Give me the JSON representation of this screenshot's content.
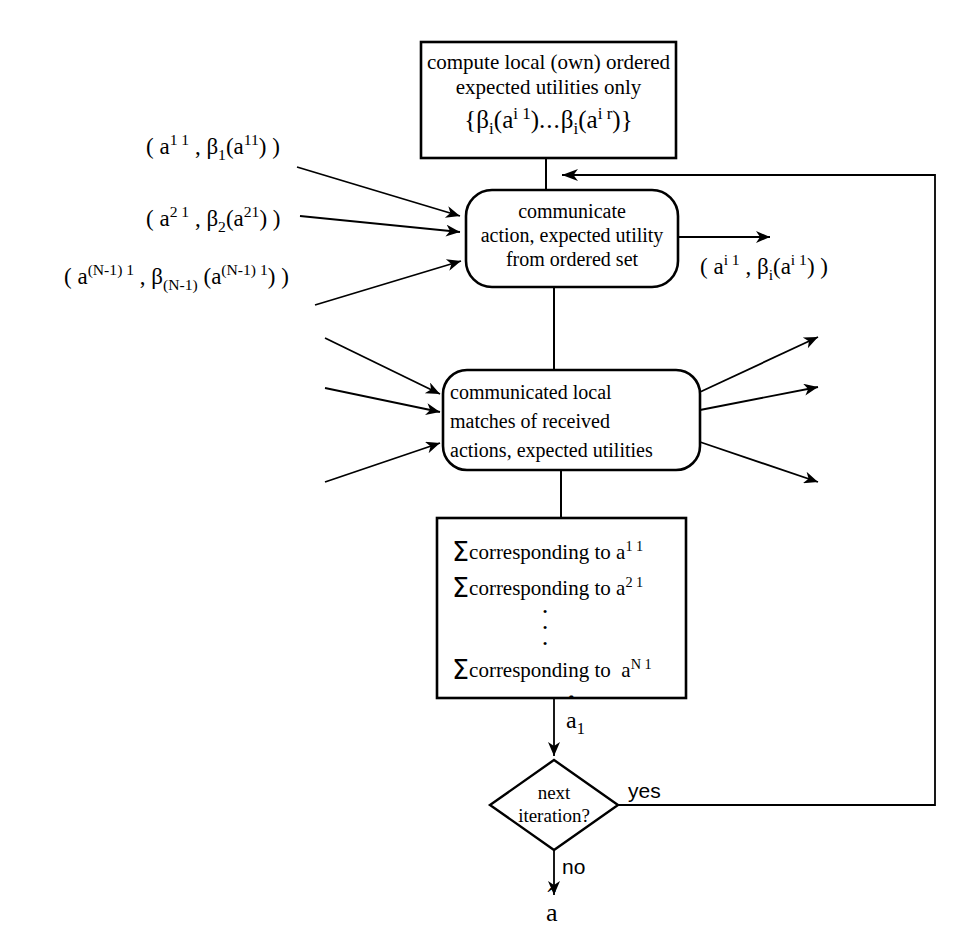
{
  "diagram": {
    "line_color": "#000000",
    "background": "#ffffff",
    "nodes": {
      "compute_box": {
        "name": "compute-local-box",
        "shape": "rectangle",
        "line1": "compute local (own)  ordered",
        "line2": "expected utilities only",
        "formula": {
          "open_brace": "{",
          "beta1": "β",
          "beta1_sub": "i",
          "arg1_open": "(a",
          "arg1_sup": "i 1",
          "arg1_close": ")",
          "ellipsis": "...",
          "beta2": "β",
          "beta2_sub": "i",
          "arg2_open": "(a",
          "arg2_sup": "i r",
          "arg2_close": ")",
          "close_brace": "}"
        }
      },
      "communicate_box": {
        "name": "communicate-action-box",
        "shape": "rounded-rectangle",
        "line1": "communicate",
        "line2": "action, expected utility",
        "line3": "from ordered set"
      },
      "match_box": {
        "name": "communicated-matches-box",
        "shape": "rounded-rectangle",
        "line1": "communicated local",
        "line2": "matches of received",
        "line3": "actions, expected utilities"
      },
      "sum_box": {
        "name": "summation-box",
        "shape": "rectangle",
        "rows": [
          {
            "sigma": "Σ",
            "text": "corresponding to",
            "base": "a",
            "sup": "1 1"
          },
          {
            "sigma": "Σ",
            "text": "corresponding to",
            "base": "a",
            "sup": "2 1"
          },
          {
            "sigma": "Σ",
            "text": "corresponding to",
            "base": "a",
            "sup": "N 1"
          }
        ],
        "vertical_dots": "·"
      },
      "decision": {
        "name": "next-iteration-decision",
        "shape": "diamond",
        "line1": "next",
        "line2": "iteration?"
      }
    },
    "edge_labels": {
      "input1": {
        "open": "( a",
        "sup": "1 1",
        "comma": " , ",
        "beta": "β",
        "beta_sub": "1",
        "arg_open": "(a",
        "arg_sup": "11",
        "arg_close": ")",
        "close": " )"
      },
      "input2": {
        "open": "( a",
        "sup": "2 1",
        "comma": " , ",
        "beta": "β",
        "beta_sub": "2",
        "arg_open": "(a",
        "arg_sup": "21",
        "arg_close": ")",
        "close": " )"
      },
      "input3": {
        "open": "( a",
        "sup": "(N-1) 1",
        "comma": " , ",
        "beta": "β",
        "beta_sub": "(N-1)",
        "arg_open": " (a",
        "arg_sup": "(N-1) 1",
        "arg_close": ")",
        "close": " )"
      },
      "output": {
        "open": "( a",
        "sup": "i 1",
        "comma": " , ",
        "beta": "β",
        "beta_sub": "i",
        "arg_open": "(a",
        "arg_sup": "i 1",
        "arg_close": ")",
        "close": " )"
      },
      "a_hat_1": {
        "hat": "ˆ",
        "base": "a",
        "sub": "1"
      },
      "a_hat_final": {
        "hat": "ˆ",
        "base": "a"
      },
      "yes": "yes",
      "no": "no"
    }
  }
}
